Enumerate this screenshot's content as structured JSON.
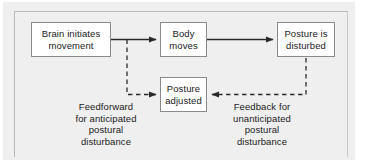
{
  "figure": {
    "background_color": "#efefef",
    "panel_color": "#efefef",
    "box_fill": "#ffffff",
    "box_border_color": "#8a8a8a",
    "line_color": "#2a2a2a",
    "text_color": "#1a1a1a"
  },
  "nodes": {
    "brain": {
      "label": "Brain initiates\nmovement"
    },
    "body": {
      "label": "Body\nmoves"
    },
    "disturbed": {
      "label": "Posture is\ndisturbed"
    },
    "adjusted": {
      "label": "Posture\nadjusted"
    }
  },
  "captions": {
    "feedforward": {
      "label": "Feedforward\nfor anticipated\npostural\ndisturbance"
    },
    "feedback": {
      "label": "Feedback  for\nunanticipated\npostural\ndisturbance"
    }
  },
  "connectors": [
    {
      "name": "brain-to-body",
      "style": "solid",
      "direction": "right",
      "from": "brain",
      "to": "body"
    },
    {
      "name": "body-to-disturbed",
      "style": "solid",
      "direction": "right",
      "from": "body",
      "to": "disturbed"
    },
    {
      "name": "feedforward-branch-to-adjusted",
      "style": "dashed",
      "direction": "right",
      "from": "brain-to-body",
      "to": "adjusted"
    },
    {
      "name": "feedback-from-disturbed-to-adjusted",
      "style": "dashed",
      "direction": "left",
      "from": "disturbed",
      "to": "adjusted"
    }
  ]
}
